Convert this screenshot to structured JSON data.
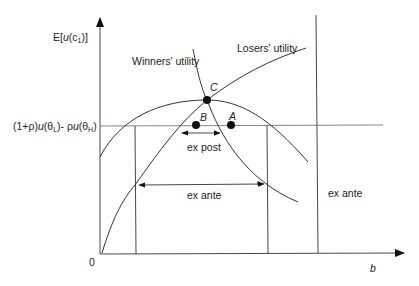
{
  "diagram": {
    "y_axis_label_prefix": "E[",
    "y_axis_label_u": "u",
    "y_axis_label_c": "(c",
    "y_axis_label_sub": "1",
    "y_axis_label_suffix": ")]",
    "x_axis_label": "b",
    "origin_label": "0",
    "reference_label": {
      "part1": "(1+ρ)",
      "u1": "u",
      "part2": "(θ",
      "sub1": "L",
      "part3": ")- ρ",
      "u2": "u",
      "part4": "(θ",
      "sub2": "H",
      "part5": ")"
    },
    "curves": {
      "winners": "Winners' utility",
      "losers": "Losers' utility"
    },
    "points": {
      "a": "A",
      "b": "B",
      "c": "C"
    },
    "intervals": {
      "ex_post": "ex post",
      "ex_ante_center": "ex ante",
      "ex_ante_right": "ex ante"
    }
  }
}
